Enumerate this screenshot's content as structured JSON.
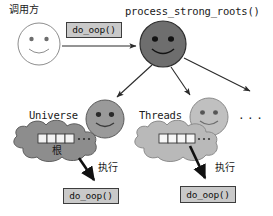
{
  "diagram": {
    "title_caller": "调用方",
    "root_call": "process_strong_roots()",
    "call_box_top": "do_oop()",
    "branches": [
      {
        "name": "Universe",
        "cloud_label": "根",
        "exec_label": "执行",
        "call_box": "do_oop()"
      },
      {
        "name": "Threads",
        "cloud_label": "",
        "exec_label": "执行",
        "call_box": "do_oop()"
      }
    ],
    "ellipsis": "...",
    "cloud_ellipsis": "...",
    "colors": {
      "caller_face": "#ffffff",
      "root_face": "#6e6e6e",
      "universe_face": "#9a9a9a",
      "threads_face": "#c0c0c0",
      "universe_cloud": "#8d8d8d",
      "threads_cloud": "#b9b9b9",
      "box_fill": "#c9c9c9",
      "stroke": "#3d3d3d",
      "background": "#ffffff"
    }
  }
}
